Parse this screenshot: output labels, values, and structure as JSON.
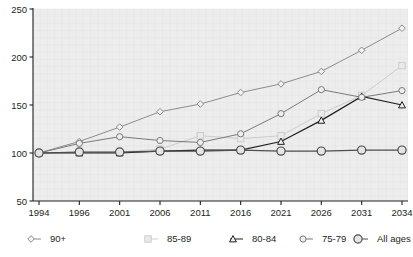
{
  "chart_data": {
    "type": "line",
    "title": "",
    "subtitle": "",
    "xlabel": "",
    "ylabel": "",
    "categories": [
      "1994",
      "1996",
      "2001",
      "2006",
      "2011",
      "2016",
      "2021",
      "2026",
      "2031",
      "2034"
    ],
    "ylim": [
      50,
      250
    ],
    "yticks": [
      50,
      100,
      150,
      200,
      250
    ],
    "grid": true,
    "legend_position": "bottom",
    "series": [
      {
        "name": "90+",
        "marker": "diamond",
        "color": "#8c8c8c",
        "values": [
          100,
          112,
          127,
          143,
          151,
          163,
          172,
          185,
          207,
          230
        ]
      },
      {
        "name": "85-89",
        "marker": "square",
        "color": "#cccccc",
        "values": [
          100,
          101,
          101,
          104,
          118,
          115,
          118,
          141,
          160,
          191
        ]
      },
      {
        "name": "80-84",
        "marker": "triangle",
        "color": "#231f20",
        "values": [
          100,
          100,
          100,
          102,
          103,
          103,
          112,
          134,
          159,
          150
        ]
      },
      {
        "name": "75-79",
        "marker": "circle-small",
        "color": "#7a7a7a",
        "values": [
          100,
          110,
          117,
          113,
          111,
          120,
          141,
          166,
          158,
          165
        ]
      },
      {
        "name": "All ages",
        "marker": "circle-large",
        "color": "#4d4d4d",
        "values": [
          100,
          101,
          101,
          102,
          102,
          103,
          102,
          102,
          103,
          103
        ]
      }
    ]
  },
  "legend": {
    "items": [
      {
        "label": "90+"
      },
      {
        "label": "85-89"
      },
      {
        "label": "80-84"
      },
      {
        "label": "75-79"
      },
      {
        "label": "All ages"
      }
    ]
  }
}
